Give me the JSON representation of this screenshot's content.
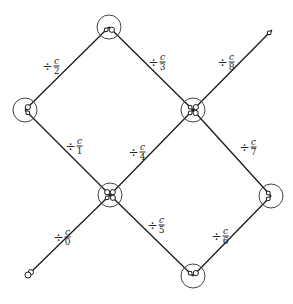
{
  "diagram": {
    "nodes": [
      {
        "id": "start",
        "x": 28,
        "y": 275,
        "ring": false
      },
      {
        "id": "n1",
        "x": 110,
        "y": 195,
        "ring": true
      },
      {
        "id": "n2",
        "x": 25,
        "y": 110,
        "ring": true
      },
      {
        "id": "n3",
        "x": 109,
        "y": 27,
        "ring": true
      },
      {
        "id": "n4",
        "x": 193,
        "y": 110,
        "ring": true
      },
      {
        "id": "n5",
        "x": 271,
        "y": 196,
        "ring": true
      },
      {
        "id": "n6",
        "x": 193,
        "y": 276,
        "ring": true
      },
      {
        "id": "end",
        "x": 272,
        "y": 30,
        "ring": false
      }
    ],
    "edges": [
      {
        "from": "start",
        "to": "n1",
        "label": {
          "op": "÷",
          "num": "c",
          "den": "0",
          "x": 62,
          "y": 237
        }
      },
      {
        "from": "n1",
        "to": "n2",
        "label": {
          "op": "÷",
          "num": "c",
          "den": "1",
          "x": 74,
          "y": 146
        }
      },
      {
        "from": "n2",
        "to": "n3",
        "label": {
          "op": "÷",
          "num": "c",
          "den": "2",
          "x": 51,
          "y": 66
        }
      },
      {
        "from": "n3",
        "to": "n4",
        "label": {
          "op": "÷",
          "num": "c",
          "den": "3",
          "x": 157,
          "y": 62
        }
      },
      {
        "from": "n1",
        "to": "n4",
        "label": {
          "op": "÷",
          "num": "c",
          "den": "4",
          "x": 137,
          "y": 152
        }
      },
      {
        "from": "n1",
        "to": "n6",
        "label": {
          "op": "÷",
          "num": "c",
          "den": "5",
          "x": 156,
          "y": 225
        }
      },
      {
        "from": "n6",
        "to": "n5",
        "label": {
          "op": "÷",
          "num": "c",
          "den": "6",
          "x": 220,
          "y": 236
        }
      },
      {
        "from": "n4",
        "to": "n5",
        "label": {
          "op": "÷",
          "num": "c",
          "den": "7",
          "x": 248,
          "y": 147
        }
      },
      {
        "from": "n4",
        "to": "end",
        "label": {
          "op": "÷",
          "num": "c",
          "den": "8",
          "x": 226,
          "y": 62
        }
      }
    ],
    "colors": {
      "line": "#1a1a1a",
      "ring": "#444444",
      "background": "#ffffff"
    }
  }
}
